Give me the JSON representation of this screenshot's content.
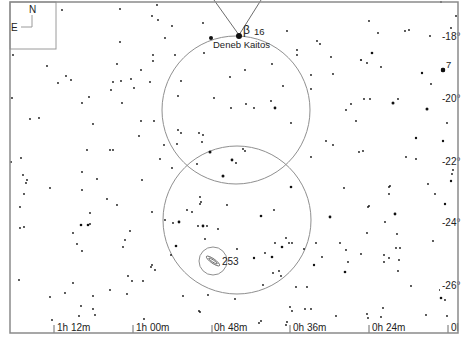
{
  "chart": {
    "type": "star-chart",
    "compass": {
      "north": "N",
      "east": "E"
    },
    "ra_labels": [
      {
        "text": "1h 12m",
        "x": 57,
        "y": 331
      },
      {
        "text": "1h 00m",
        "x": 136,
        "y": 331
      },
      {
        "text": "0h 48m",
        "x": 214,
        "y": 331
      },
      {
        "text": "0h 36m",
        "x": 293,
        "y": 331
      },
      {
        "text": "0h 24m",
        "x": 372,
        "y": 331
      },
      {
        "text": "0l",
        "x": 451,
        "y": 331
      }
    ],
    "dec_labels": [
      {
        "text": "-18°",
        "x": 442,
        "y": 40
      },
      {
        "text": "-20°",
        "x": 442,
        "y": 102
      },
      {
        "text": "-22°",
        "x": 442,
        "y": 165
      },
      {
        "text": "-24°",
        "x": 442,
        "y": 226
      },
      {
        "text": "-26°",
        "x": 442,
        "y": 289
      }
    ],
    "named_objects": [
      {
        "name": "Deneb Kaitos",
        "greek": "β",
        "flamsteed": "16",
        "x": 239,
        "y": 36
      },
      {
        "name": "7",
        "x": 444,
        "y": 70
      },
      {
        "name": "253",
        "x": 212,
        "y": 261
      }
    ],
    "fov_circles": [
      {
        "cx": 236,
        "cy": 110,
        "r": 74
      },
      {
        "cx": 237,
        "cy": 220,
        "r": 74
      },
      {
        "cx": 213,
        "cy": 261,
        "r": 14
      }
    ],
    "accent_colors": {
      "stars": "#111111",
      "circles": "#8f8f8f",
      "frame": "#8a8a8a"
    }
  },
  "stars": [
    [
      62,
      10,
      0.9
    ],
    [
      120,
      9,
      0.9
    ],
    [
      157,
      5,
      0.9
    ],
    [
      152,
      16,
      0.9
    ],
    [
      158,
      20,
      0.9
    ],
    [
      203,
      23,
      0.9
    ],
    [
      172,
      26,
      0.9
    ],
    [
      165,
      38,
      0.9
    ],
    [
      120,
      42,
      0.9
    ],
    [
      211,
      38,
      2.0
    ],
    [
      287,
      31,
      0.9
    ],
    [
      317,
      41,
      0.9
    ],
    [
      320,
      44,
      0.9
    ],
    [
      297,
      50,
      0.9
    ],
    [
      297,
      55,
      0.9
    ],
    [
      331,
      57,
      0.9
    ],
    [
      372,
      53,
      1.3
    ],
    [
      361,
      60,
      1.1
    ],
    [
      367,
      63,
      0.9
    ],
    [
      381,
      67,
      0.9
    ],
    [
      405,
      31,
      0.9
    ],
    [
      409,
      30,
      0.9
    ],
    [
      430,
      36,
      0.9
    ],
    [
      451,
      28,
      0.9
    ],
    [
      456,
      16,
      0.9
    ],
    [
      441,
      2,
      0.9
    ],
    [
      369,
      21,
      0.9
    ],
    [
      378,
      33,
      0.9
    ],
    [
      13,
      55,
      0.9
    ],
    [
      47,
      66,
      0.9
    ],
    [
      66,
      76,
      0.9
    ],
    [
      71,
      80,
      0.9
    ],
    [
      58,
      83,
      0.9
    ],
    [
      117,
      64,
      0.9
    ],
    [
      113,
      82,
      0.9
    ],
    [
      111,
      90,
      0.9
    ],
    [
      121,
      81,
      0.9
    ],
    [
      131,
      79,
      0.9
    ],
    [
      134,
      88,
      0.9
    ],
    [
      141,
      70,
      0.9
    ],
    [
      150,
      82,
      0.9
    ],
    [
      153,
      55,
      0.9
    ],
    [
      153,
      61,
      0.9
    ],
    [
      175,
      55,
      0.9
    ],
    [
      204,
      53,
      0.9
    ],
    [
      245,
      70,
      0.9
    ],
    [
      230,
      77,
      0.9
    ],
    [
      283,
      86,
      0.9
    ],
    [
      272,
      64,
      0.9
    ],
    [
      311,
      75,
      0.9
    ],
    [
      333,
      74,
      0.9
    ],
    [
      364,
      99,
      0.9
    ],
    [
      370,
      99,
      0.9
    ],
    [
      393,
      103,
      1.5
    ],
    [
      398,
      99,
      0.9
    ],
    [
      427,
      109,
      1.5
    ],
    [
      422,
      73,
      1.2
    ],
    [
      431,
      84,
      0.9
    ],
    [
      443,
      70,
      2.2
    ],
    [
      12,
      98,
      0.9
    ],
    [
      30,
      119,
      0.9
    ],
    [
      39,
      118,
      0.9
    ],
    [
      82,
      103,
      0.9
    ],
    [
      89,
      97,
      0.9
    ],
    [
      93,
      124,
      0.9
    ],
    [
      122,
      103,
      0.9
    ],
    [
      181,
      81,
      0.9
    ],
    [
      178,
      96,
      0.9
    ],
    [
      214,
      98,
      0.9
    ],
    [
      231,
      108,
      0.9
    ],
    [
      246,
      104,
      0.9
    ],
    [
      254,
      108,
      0.9
    ],
    [
      271,
      101,
      0.9
    ],
    [
      275,
      108,
      1.4
    ],
    [
      291,
      123,
      0.9
    ],
    [
      311,
      89,
      0.9
    ],
    [
      346,
      110,
      0.9
    ],
    [
      351,
      104,
      0.9
    ],
    [
      356,
      121,
      0.9
    ],
    [
      447,
      123,
      0.9
    ],
    [
      139,
      136,
      0.9
    ],
    [
      154,
      121,
      0.9
    ],
    [
      141,
      121,
      0.9
    ],
    [
      164,
      145,
      0.9
    ],
    [
      178,
      130,
      0.9
    ],
    [
      181,
      133,
      0.9
    ],
    [
      177,
      144,
      0.9
    ],
    [
      199,
      133,
      0.9
    ],
    [
      203,
      135,
      0.9
    ],
    [
      202,
      142,
      0.9
    ],
    [
      210,
      152,
      1.5
    ],
    [
      232,
      160,
      1.4
    ],
    [
      236,
      163,
      0.9
    ],
    [
      245,
      151,
      0.9
    ],
    [
      243,
      149,
      0.9
    ],
    [
      223,
      176,
      1.5
    ],
    [
      197,
      164,
      0.9
    ],
    [
      172,
      168,
      0.9
    ],
    [
      160,
      159,
      0.9
    ],
    [
      142,
      180,
      0.9
    ],
    [
      87,
      150,
      0.9
    ],
    [
      110,
      150,
      0.9
    ],
    [
      113,
      150,
      0.9
    ],
    [
      21,
      158,
      0.9
    ],
    [
      11,
      162,
      0.9
    ],
    [
      82,
      172,
      0.9
    ],
    [
      97,
      179,
      0.9
    ],
    [
      23,
      175,
      0.9
    ],
    [
      27,
      180,
      0.9
    ],
    [
      26,
      183,
      0.9
    ],
    [
      24,
      194,
      0.9
    ],
    [
      50,
      188,
      0.9
    ],
    [
      82,
      190,
      0.9
    ],
    [
      326,
      141,
      0.9
    ],
    [
      333,
      145,
      0.9
    ],
    [
      311,
      157,
      0.9
    ],
    [
      359,
      152,
      0.9
    ],
    [
      363,
      151,
      0.9
    ],
    [
      406,
      157,
      0.9
    ],
    [
      416,
      159,
      0.9
    ],
    [
      416,
      138,
      1.2
    ],
    [
      443,
      141,
      1.2
    ],
    [
      452,
      161,
      0.9
    ],
    [
      452,
      174,
      0.9
    ],
    [
      453,
      170,
      0.9
    ],
    [
      451,
      181,
      1.2
    ],
    [
      428,
      184,
      0.9
    ],
    [
      435,
      194,
      0.9
    ],
    [
      344,
      188,
      0.9
    ],
    [
      389,
      194,
      0.9
    ],
    [
      390,
      186,
      0.9
    ],
    [
      291,
      187,
      1.3
    ],
    [
      20,
      207,
      0.9
    ],
    [
      24,
      227,
      0.9
    ],
    [
      20,
      228,
      0.9
    ],
    [
      90,
      213,
      0.9
    ],
    [
      107,
      199,
      0.9
    ],
    [
      117,
      205,
      0.9
    ],
    [
      90,
      224,
      0.9
    ],
    [
      81,
      225,
      1.3
    ],
    [
      88,
      225,
      1.3
    ],
    [
      73,
      233,
      0.9
    ],
    [
      77,
      244,
      0.9
    ],
    [
      82,
      251,
      0.9
    ],
    [
      130,
      231,
      0.9
    ],
    [
      125,
      240,
      0.9
    ],
    [
      123,
      247,
      0.9
    ],
    [
      152,
      212,
      0.9
    ],
    [
      165,
      220,
      0.9
    ],
    [
      173,
      223,
      0.9
    ],
    [
      179,
      222,
      1.4
    ],
    [
      187,
      210,
      0.9
    ],
    [
      192,
      212,
      0.9
    ],
    [
      200,
      197,
      0.9
    ],
    [
      201,
      202,
      0.9
    ],
    [
      200,
      204,
      0.9
    ],
    [
      198,
      226,
      0.9
    ],
    [
      203,
      226,
      1.4
    ],
    [
      207,
      226,
      0.9
    ],
    [
      218,
      229,
      0.9
    ],
    [
      227,
      205,
      0.9
    ],
    [
      205,
      239,
      0.9
    ],
    [
      176,
      246,
      1.3
    ],
    [
      171,
      255,
      0.9
    ],
    [
      237,
      249,
      0.9
    ],
    [
      261,
      216,
      1.3
    ],
    [
      274,
      210,
      0.9
    ],
    [
      275,
      243,
      0.9
    ],
    [
      286,
      238,
      0.9
    ],
    [
      289,
      243,
      0.9
    ],
    [
      282,
      247,
      1.3
    ],
    [
      292,
      243,
      0.9
    ],
    [
      304,
      249,
      0.9
    ],
    [
      254,
      258,
      1.2
    ],
    [
      265,
      253,
      0.9
    ],
    [
      272,
      257,
      1.3
    ],
    [
      273,
      273,
      0.9
    ],
    [
      279,
      271,
      0.9
    ],
    [
      281,
      276,
      0.9
    ],
    [
      314,
      265,
      1.2
    ],
    [
      316,
      243,
      0.9
    ],
    [
      322,
      257,
      0.9
    ],
    [
      330,
      217,
      1.4
    ],
    [
      340,
      243,
      0.9
    ],
    [
      346,
      250,
      0.9
    ],
    [
      348,
      262,
      0.9
    ],
    [
      345,
      272,
      1.3
    ],
    [
      361,
      254,
      0.9
    ],
    [
      367,
      233,
      0.9
    ],
    [
      368,
      207,
      0.9
    ],
    [
      369,
      206,
      0.9
    ],
    [
      385,
      222,
      0.9
    ],
    [
      389,
      187,
      0.9
    ],
    [
      395,
      214,
      1.4
    ],
    [
      396,
      248,
      0.9
    ],
    [
      397,
      234,
      0.9
    ],
    [
      400,
      248,
      0.9
    ],
    [
      384,
      262,
      0.9
    ],
    [
      389,
      258,
      0.9
    ],
    [
      384,
      255,
      0.9
    ],
    [
      399,
      260,
      0.9
    ],
    [
      398,
      271,
      0.9
    ],
    [
      433,
      241,
      0.9
    ],
    [
      445,
      204,
      1.2
    ],
    [
      411,
      286,
      0.9
    ],
    [
      440,
      290,
      0.9
    ],
    [
      445,
      288,
      0.9
    ],
    [
      441,
      298,
      1.3
    ],
    [
      445,
      300,
      0.9
    ],
    [
      447,
      316,
      0.9
    ],
    [
      19,
      280,
      0.9
    ],
    [
      73,
      283,
      0.9
    ],
    [
      50,
      297,
      0.9
    ],
    [
      65,
      293,
      0.9
    ],
    [
      93,
      296,
      0.9
    ],
    [
      110,
      290,
      0.9
    ],
    [
      128,
      276,
      0.9
    ],
    [
      127,
      294,
      0.9
    ],
    [
      132,
      281,
      0.9
    ],
    [
      143,
      281,
      0.9
    ],
    [
      152,
      265,
      0.9
    ],
    [
      155,
      270,
      0.9
    ],
    [
      151,
      267,
      0.9
    ],
    [
      183,
      296,
      0.9
    ],
    [
      208,
      295,
      0.9
    ],
    [
      235,
      299,
      0.9
    ],
    [
      263,
      285,
      0.9
    ],
    [
      296,
      287,
      0.9
    ],
    [
      307,
      287,
      0.9
    ],
    [
      290,
      307,
      0.9
    ],
    [
      292,
      311,
      0.9
    ],
    [
      305,
      309,
      0.9
    ],
    [
      336,
      316,
      0.9
    ],
    [
      367,
      314,
      0.9
    ],
    [
      368,
      318,
      0.9
    ],
    [
      381,
      317,
      0.9
    ],
    [
      383,
      308,
      0.9
    ],
    [
      426,
      315,
      0.9
    ],
    [
      81,
      306,
      0.9
    ],
    [
      79,
      316,
      0.9
    ],
    [
      93,
      309,
      0.9
    ],
    [
      95,
      315,
      0.9
    ],
    [
      144,
      319,
      0.9
    ],
    [
      52,
      320,
      0.9
    ],
    [
      259,
      323,
      0.9
    ],
    [
      261,
      321,
      0.9
    ],
    [
      287,
      322,
      0.9
    ],
    [
      286,
      325,
      0.9
    ],
    [
      200,
      312,
      0.9
    ],
    [
      199,
      311,
      0.9
    ],
    [
      311,
      309,
      0.9
    ]
  ]
}
